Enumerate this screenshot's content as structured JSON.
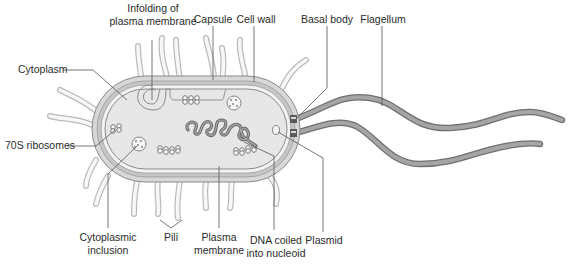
{
  "labels": {
    "infolding_line1": "Infolding of",
    "infolding_line2": "plasma membrane",
    "capsule": "Capsule",
    "cell_wall": "Cell wall",
    "basal_body": "Basal body",
    "flagellum": "Flagellum",
    "cytoplasm": "Cytoplasm",
    "ribosomes": "70S ribosomes",
    "inclusion_line1": "Cytoplasmic",
    "inclusion_line2": "inclusion",
    "pili": "Pili",
    "plasma_line1": "Plasma",
    "plasma_line2": "membrane",
    "dna_line1": "DNA coiled",
    "dna_line2": "into nucleoid",
    "plasmid": "Plasmid"
  },
  "colors": {
    "capsule": "#d6d6d6",
    "cell_wall": "#c2c2c2",
    "cytoplasm": "#e9e9e9",
    "dna": "#6a6a6a",
    "flagellum": "#8c8c8c",
    "outline": "#8a8a8a"
  }
}
